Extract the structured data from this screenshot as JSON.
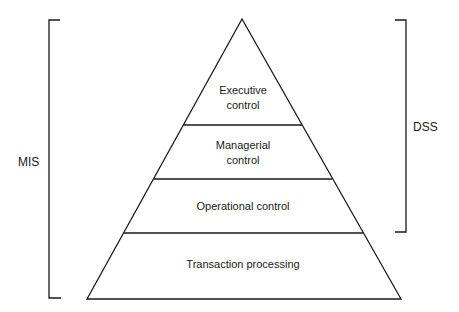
{
  "diagram": {
    "layers": [
      {
        "id": "executive",
        "lines": [
          "Executive",
          "control"
        ]
      },
      {
        "id": "managerial",
        "lines": [
          "Managerial",
          "control"
        ]
      },
      {
        "id": "operational",
        "lines": [
          "Operational control"
        ]
      },
      {
        "id": "transaction",
        "lines": [
          "Transaction processing"
        ]
      }
    ],
    "brackets": {
      "left": {
        "label": "MIS",
        "spans": "all layers"
      },
      "right": {
        "label": "DSS",
        "spans": "executive, managerial, operational"
      }
    },
    "colors": {
      "stroke": "#1a1a1a",
      "background": "#ffffff"
    }
  }
}
